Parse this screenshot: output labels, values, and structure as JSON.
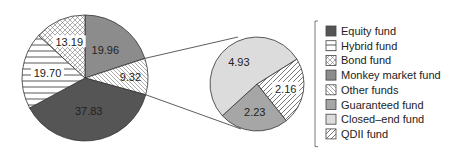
{
  "chart_data": {
    "type": "pie",
    "title": "",
    "main_pie": {
      "slices": [
        {
          "name": "Monkey market fund",
          "value": 19.96,
          "label": "19.96",
          "fill": "#8c8c8c",
          "pattern": "solid"
        },
        {
          "name": "Other funds",
          "value": 9.32,
          "label": "9.32",
          "fill": "#ffffff",
          "pattern": "diag-back"
        },
        {
          "name": "Equity fund",
          "value": 37.83,
          "label": "37.83",
          "fill": "#555555",
          "pattern": "solid"
        },
        {
          "name": "Hybrid fund",
          "value": 19.7,
          "label": "19.70",
          "fill": "#ffffff",
          "pattern": "horizontal"
        },
        {
          "name": "Bond fund",
          "value": 13.19,
          "label": "13.19",
          "fill": "#ffffff",
          "pattern": "crosshatch"
        }
      ]
    },
    "secondary_pie": {
      "breakdown_of": "Other funds",
      "slices": [
        {
          "name": "QDII fund",
          "value": 2.16,
          "label": "2.16",
          "fill": "#ffffff",
          "pattern": "diag-fwd"
        },
        {
          "name": "Guaranteed fund",
          "value": 2.23,
          "label": "2.23",
          "fill": "#a6a6a6",
          "pattern": "solid"
        },
        {
          "name": "Closed–end fund",
          "value": 4.93,
          "label": "4.93",
          "fill": "#dcdcdc",
          "pattern": "solid"
        }
      ]
    },
    "legend": {
      "placement": "right",
      "entries": [
        {
          "label": "Equity fund",
          "fill": "#555555",
          "pattern": "solid"
        },
        {
          "label": "Hybrid fund",
          "fill": "#ffffff",
          "pattern": "horizontal"
        },
        {
          "label": "Bond fund",
          "fill": "#ffffff",
          "pattern": "crosshatch"
        },
        {
          "label": "Monkey market fund",
          "fill": "#8c8c8c",
          "pattern": "solid"
        },
        {
          "label": "Other funds",
          "fill": "#ffffff",
          "pattern": "diag-back"
        },
        {
          "label": "Guaranteed fund",
          "fill": "#a6a6a6",
          "pattern": "solid"
        },
        {
          "label": "Closed–end fund",
          "fill": "#dcdcdc",
          "pattern": "solid"
        },
        {
          "label": "QDII fund",
          "fill": "#ffffff",
          "pattern": "diag-fwd"
        }
      ]
    }
  }
}
